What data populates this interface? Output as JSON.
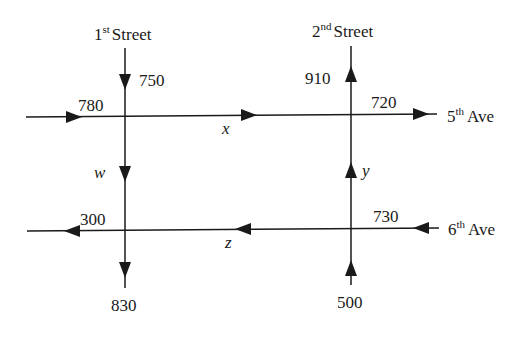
{
  "diagram": {
    "type": "traffic-flow-network",
    "streets": {
      "first": {
        "num": "1",
        "sup": "st",
        "name": "Street"
      },
      "second": {
        "num": "2",
        "sup": "nd",
        "name": "Street"
      }
    },
    "avenues": {
      "fifth": {
        "num": "5",
        "sup": "th",
        "name": "Ave"
      },
      "sixth": {
        "num": "6",
        "sup": "th",
        "name": "Ave"
      }
    },
    "flows": {
      "first_street_in_top": "750",
      "fifth_ave_in_left": "780",
      "second_street_out_top": "910",
      "fifth_ave_out_right": "720",
      "sixth_ave_out_left": "300",
      "sixth_ave_in_right": "730",
      "first_street_out_bottom": "830",
      "second_street_in_bottom": "500"
    },
    "unknowns": {
      "fifth_ave_between": "x",
      "second_street_between": "y",
      "sixth_ave_between": "z",
      "first_street_between": "w"
    },
    "colors": {
      "ink": "#1a1a1a",
      "background": "#ffffff"
    }
  }
}
